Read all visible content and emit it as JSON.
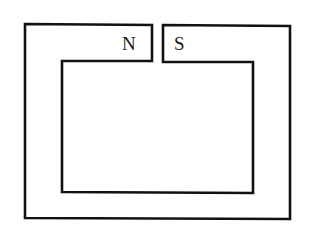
{
  "diagram": {
    "stroke_color": "#111111",
    "background_color": "#ffffff",
    "poles": {
      "left": "N",
      "right": "S"
    }
  }
}
